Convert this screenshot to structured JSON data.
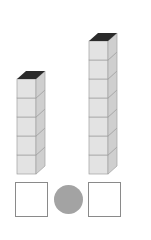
{
  "towers": [
    {
      "name": "left-tower",
      "cube_count": 5
    },
    {
      "name": "right-tower",
      "cube_count": 7
    }
  ],
  "answer_boxes": [
    {
      "name": "left-answer-box",
      "value": ""
    },
    {
      "name": "right-answer-box",
      "value": ""
    }
  ],
  "comparison_symbol": {
    "name": "comparison-circle",
    "value": ""
  },
  "colors": {
    "cube_front": "#e3e3e3",
    "cube_side": "#cfcfcf",
    "cube_top": "#2b2b2b",
    "cube_edge": "#a0a0a0",
    "circle_fill": "#a3a3a3",
    "box_border": "#8a8a8a"
  }
}
